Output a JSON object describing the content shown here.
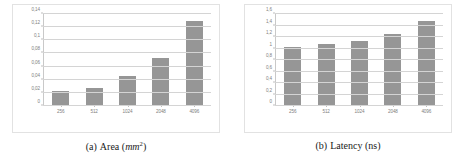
{
  "figure": {
    "subfigures": [
      {
        "caption_label": "(a)",
        "caption_name": "Area",
        "caption_unit_italic": "mm",
        "caption_unit_sup": "2",
        "caption_full": "(a) Area (mm2)"
      },
      {
        "caption_label": "(b)",
        "caption_name": "Latency",
        "caption_unit_plain": "ns",
        "caption_full": "(b) Latency (ns)"
      }
    ]
  },
  "chart_data": [
    {
      "type": "bar",
      "title": "",
      "xlabel": "",
      "ylabel": "",
      "categories": [
        "256",
        "512",
        "1024",
        "2048",
        "4096"
      ],
      "values": [
        0.021,
        0.026,
        0.045,
        0.073,
        0.13
      ],
      "ylim": [
        0,
        0.14
      ],
      "yticks": [
        0,
        0.02,
        0.04,
        0.06,
        0.08,
        0.1,
        0.12,
        0.14
      ],
      "ytick_labels": [
        "0",
        "0,02",
        "0,04",
        "0,06",
        "0,08",
        "0,1",
        "0,12",
        "0,14"
      ],
      "grid": true,
      "legend": "none",
      "bar_color": "#969696",
      "grid_color": "#d4d4d4",
      "caption": "(a) Area (mm2)"
    },
    {
      "type": "bar",
      "title": "",
      "xlabel": "",
      "ylabel": "",
      "categories": [
        "256",
        "512",
        "1024",
        "2048",
        "4096"
      ],
      "values": [
        1.02,
        1.07,
        1.12,
        1.24,
        1.47
      ],
      "ylim": [
        0,
        1.6
      ],
      "yticks": [
        0,
        0.2,
        0.4,
        0.6,
        0.8,
        1.0,
        1.2,
        1.4,
        1.6
      ],
      "ytick_labels": [
        "0",
        "0,2",
        "0,4",
        "0,6",
        "0,8",
        "1",
        "1,2",
        "1,4",
        "1,6"
      ],
      "grid": true,
      "legend": "none",
      "bar_color": "#969696",
      "grid_color": "#d4d4d4",
      "caption": "(b) Latency (ns)"
    }
  ]
}
